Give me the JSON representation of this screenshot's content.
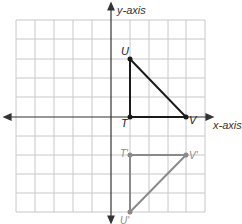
{
  "axes": {
    "x_label": "x-axis",
    "y_label": "y-axis"
  },
  "grid": {
    "columns": 10,
    "rows": 10,
    "x_range": [
      -5,
      5
    ],
    "y_range": [
      -5,
      5
    ]
  },
  "original_triangle": {
    "color": "#1a1a1a",
    "vertices": [
      {
        "name": "T",
        "x": 1,
        "y": 0
      },
      {
        "name": "U",
        "x": 1,
        "y": 3
      },
      {
        "name": "V",
        "x": 4,
        "y": 0
      }
    ]
  },
  "image_triangle": {
    "color": "#8a8a8a",
    "vertices": [
      {
        "name": "T'",
        "x": 1,
        "y": -2
      },
      {
        "name": "U'",
        "x": 1,
        "y": -5
      },
      {
        "name": "V'",
        "x": 4,
        "y": -2
      }
    ]
  },
  "labels": {
    "T": "T",
    "U": "U",
    "V": "V",
    "T_prime": "T'",
    "U_prime": "U'",
    "V_prime": "V'"
  }
}
